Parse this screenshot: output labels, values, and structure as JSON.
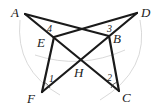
{
  "diagram": {
    "points": {
      "A": {
        "label": "A",
        "x": 25,
        "y": 14
      },
      "D": {
        "label": "D",
        "x": 137,
        "y": 13
      },
      "E": {
        "label": "E",
        "x": 54,
        "y": 37
      },
      "B": {
        "label": "B",
        "x": 109,
        "y": 36
      },
      "H": {
        "label": "H",
        "x": 80,
        "y": 60
      },
      "F": {
        "label": "F",
        "x": 42,
        "y": 92
      },
      "C": {
        "label": "C",
        "x": 119,
        "y": 91
      }
    },
    "segments": [
      "AB",
      "AC",
      "DE",
      "DF",
      "EF",
      "BC"
    ],
    "angle_labels": {
      "a1": "1",
      "a2": "2",
      "a3": "3",
      "a4": "4"
    }
  }
}
